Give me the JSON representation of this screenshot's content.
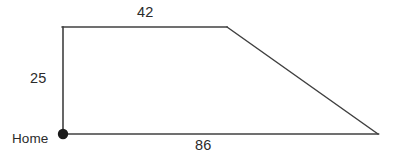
{
  "figure": {
    "type": "geometry-diagram",
    "shape": "right-trapezoid",
    "stroke_color": "#404040",
    "background_color": "#ffffff",
    "text_color": "#2b2b2b",
    "vertex_marker": {
      "name": "home-point",
      "label": "Home",
      "cx": 63,
      "cy": 134,
      "r": 5,
      "fill": "#1a1a1a"
    },
    "vertices": [
      {
        "name": "home-corner",
        "x": 63,
        "y": 134
      },
      {
        "name": "top-left-corner",
        "x": 63,
        "y": 27
      },
      {
        "name": "top-right-corner",
        "x": 227,
        "y": 27
      },
      {
        "name": "far-right-corner",
        "x": 378,
        "y": 134
      }
    ],
    "sides": [
      {
        "name": "left-side",
        "label": "25",
        "from": "home-corner",
        "to": "top-left-corner"
      },
      {
        "name": "top-side",
        "label": "42",
        "from": "top-left-corner",
        "to": "top-right-corner"
      },
      {
        "name": "slanted-side",
        "label": "",
        "from": "top-right-corner",
        "to": "far-right-corner"
      },
      {
        "name": "bottom-side",
        "label": "86",
        "from": "home-corner",
        "to": "far-right-corner"
      }
    ],
    "labels": {
      "top": "42",
      "left": "25",
      "bottom": "86",
      "home": "Home"
    }
  }
}
